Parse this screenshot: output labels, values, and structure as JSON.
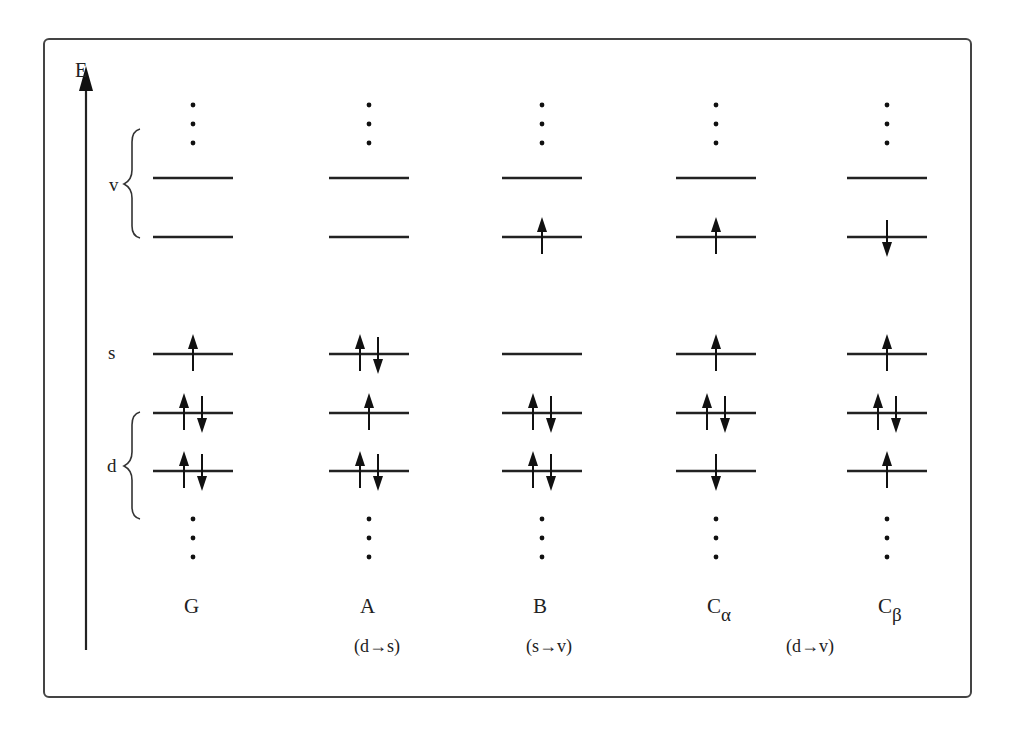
{
  "diagram": {
    "axis_label": "E",
    "group_labels": {
      "v": "v",
      "s": "s",
      "d": "d"
    },
    "columns": [
      {
        "id": "G",
        "label": "G",
        "sub": "",
        "x": 193,
        "levels": {
          "v2": "",
          "v1": "",
          "s": "up",
          "d2": "pair",
          "d1": "pair"
        }
      },
      {
        "id": "A",
        "label": "A",
        "sub": "",
        "x": 369,
        "levels": {
          "v2": "",
          "v1": "",
          "s": "pair",
          "d2": "up",
          "d1": "pair"
        }
      },
      {
        "id": "B",
        "label": "B",
        "sub": "",
        "x": 542,
        "levels": {
          "v2": "",
          "v1": "up",
          "s": "",
          "d2": "pair",
          "d1": "pair"
        }
      },
      {
        "id": "Ca",
        "label": "C",
        "sub": "α",
        "x": 716,
        "levels": {
          "v2": "",
          "v1": "up",
          "s": "up",
          "d2": "pair",
          "d1": "down"
        }
      },
      {
        "id": "Cb",
        "label": "C",
        "sub": "β",
        "x": 887,
        "levels": {
          "v2": "",
          "v1": "down",
          "s": "up",
          "d2": "pair",
          "d1": "up"
        }
      }
    ],
    "transitions": [
      {
        "text": "(d→s)",
        "x": 377
      },
      {
        "text": "(s→v)",
        "x": 549
      },
      {
        "text": "(d→v)",
        "x": 810
      }
    ],
    "level_y": {
      "v2": 178,
      "v1": 237,
      "s": 354,
      "d2": 413,
      "d1": 471
    },
    "colors": {
      "line": "#222222",
      "frame": "#444444"
    }
  }
}
